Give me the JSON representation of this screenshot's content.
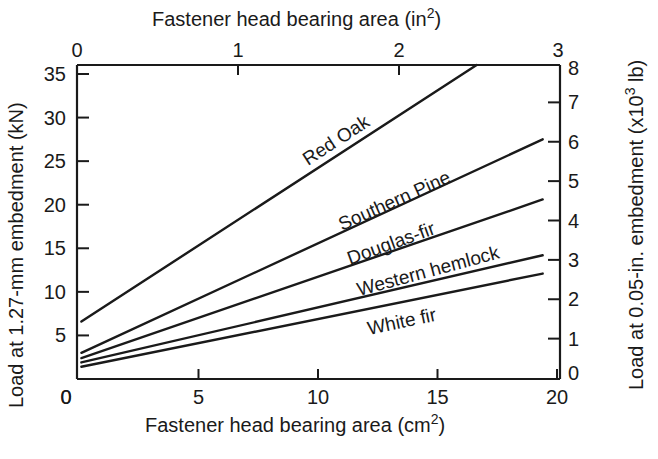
{
  "chart_data": {
    "type": "line",
    "title": "",
    "xlabel": "Fastener head bearing area (cm²)",
    "xlabel_main": "Fastener head bearing area (cm",
    "xlabel_sup": "2",
    "xlabel_end": ")",
    "ylabel": "Load at 1.27-mm embedment (kN)",
    "x2label": "Fastener head bearing area (in²)",
    "x2label_main": "Fastener head bearing area (in",
    "x2label_sup": "2",
    "x2label_end": ")",
    "y2label": "Load at 0.05-in. embedment (x10³ lb)",
    "y2label_main": "Load at 0.05-in. embedment (x10",
    "y2label_sup": "3",
    "y2label_end": " lb)",
    "xlim": [
      0,
      20
    ],
    "ylim": [
      0,
      35
    ],
    "x2lim": [
      0,
      3
    ],
    "y2lim": [
      0,
      8
    ],
    "xticks": [
      "0",
      "5",
      "10",
      "15",
      "20"
    ],
    "xtick_values": [
      0,
      5,
      10,
      15,
      20
    ],
    "yticks": [
      "5",
      "10",
      "15",
      "20",
      "25",
      "30",
      "35"
    ],
    "ytick_values": [
      5,
      10,
      15,
      20,
      25,
      30,
      35
    ],
    "y_zero_label": "0",
    "x2ticks": [
      "0",
      "1",
      "2",
      "3"
    ],
    "x2tick_values": [
      0,
      1,
      2,
      3
    ],
    "y2ticks": [
      "0",
      "1",
      "2",
      "3",
      "4",
      "5",
      "6",
      "7",
      "8"
    ],
    "y2tick_values": [
      0,
      1,
      2,
      3,
      4,
      5,
      6,
      7,
      8
    ],
    "grid": false,
    "legend": "inline labels",
    "series": [
      {
        "name": "Red Oak",
        "x": [
          0.1,
          16.9
        ],
        "y": [
          6.6,
          36.5
        ]
      },
      {
        "name": "Southern Pine",
        "x": [
          0.1,
          19.4
        ],
        "y": [
          3.0,
          27.5
        ]
      },
      {
        "name": "Douglas-fir",
        "x": [
          0.1,
          19.4
        ],
        "y": [
          2.4,
          20.6
        ]
      },
      {
        "name": "Western hemlock",
        "x": [
          0.1,
          19.4
        ],
        "y": [
          1.9,
          14.2
        ]
      },
      {
        "name": "White fir",
        "x": [
          0.1,
          19.4
        ],
        "y": [
          1.4,
          12.1
        ]
      }
    ]
  }
}
